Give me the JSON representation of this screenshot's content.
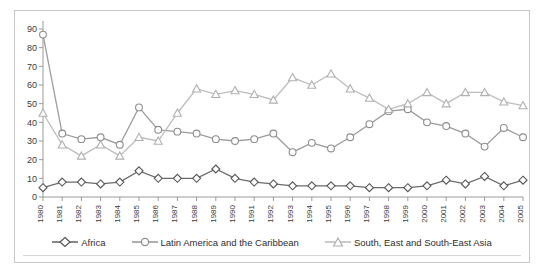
{
  "chart_data": {
    "type": "line",
    "title": "",
    "xlabel": "",
    "ylabel": "",
    "ylim": [
      0,
      90
    ],
    "ytick_step": 10,
    "grid": false,
    "legend_position": "bottom",
    "categories": [
      "1980",
      "1981",
      "1982",
      "1983",
      "1984",
      "1985",
      "1986",
      "1987",
      "1988",
      "1989",
      "1990",
      "1991",
      "1992",
      "1993",
      "1994",
      "1995",
      "1996",
      "1997",
      "1998",
      "1999",
      "2000",
      "2001",
      "2002",
      "2003",
      "2004",
      "2005"
    ],
    "yticks": [
      0,
      10,
      20,
      30,
      40,
      50,
      60,
      70,
      80,
      90
    ],
    "series": [
      {
        "name": "Africa",
        "marker": "diamond",
        "color": "#6b6b6b",
        "values": [
          5,
          8,
          8,
          7,
          8,
          14,
          10,
          10,
          10,
          15,
          10,
          8,
          7,
          6,
          6,
          6,
          6,
          5,
          5,
          5,
          6,
          9,
          7,
          11,
          6,
          9
        ]
      },
      {
        "name": "Latin America and the Caribbean",
        "marker": "circle",
        "color": "#9c9c9c",
        "values": [
          87,
          34,
          31,
          32,
          28,
          48,
          36,
          35,
          34,
          31,
          30,
          31,
          34,
          24,
          29,
          26,
          32,
          39,
          46,
          47,
          40,
          38,
          34,
          27,
          37,
          32
        ]
      },
      {
        "name": "South, East and South-East Asia",
        "marker": "triangle",
        "color": "#bdbdbd",
        "values": [
          45,
          28,
          22,
          28,
          22,
          32,
          30,
          45,
          58,
          55,
          57,
          55,
          52,
          64,
          60,
          66,
          58,
          53,
          47,
          50,
          56,
          50,
          56,
          56,
          51,
          49
        ]
      }
    ]
  },
  "legend": {
    "items": [
      {
        "label": "Africa"
      },
      {
        "label": "Latin America and the Caribbean"
      },
      {
        "label": "South, East and South-East Asia"
      }
    ]
  }
}
